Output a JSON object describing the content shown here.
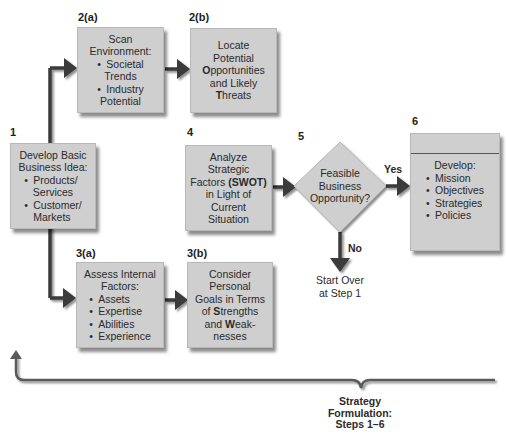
{
  "steps": {
    "s1": {
      "number": "1",
      "title_line1": "Develop Basic",
      "title_line2": "Business Idea:",
      "bullets": [
        "Products/",
        "Services",
        "Customer/",
        "Markets"
      ]
    },
    "s2a": {
      "number": "2(a)",
      "title_line1": "Scan",
      "title_line2": "Environment:",
      "bullets": [
        "Societal",
        "Trends",
        "Industry",
        "Potential"
      ]
    },
    "s2b": {
      "number": "2(b)",
      "lines": [
        "Locate",
        "Potential"
      ],
      "opp_bold": "O",
      "opp_rest": "pportunities",
      "line4": "and Likely",
      "threat_bold": "T",
      "threat_rest": "hreats"
    },
    "s3a": {
      "number": "3(a)",
      "title_line1": "Assess Internal",
      "title_line2": "Factors:",
      "bullets": [
        "Assets",
        "Expertise",
        "Abilities",
        "Experience"
      ]
    },
    "s3b": {
      "number": "3(b)",
      "lines": [
        "Consider",
        "Personal",
        "Goals in Terms"
      ],
      "str_pre": "of ",
      "str_bold": "S",
      "str_rest": "trengths",
      "weak_pre": "and ",
      "weak_bold": "W",
      "weak_rest": "eak-",
      "last": "nesses"
    },
    "s4": {
      "number": "4",
      "lines": [
        "Analyze",
        "Strategic"
      ],
      "factors_pre": "Factors ",
      "factors_bold": "(SWOT)",
      "lines2": [
        "in Light of",
        "Current",
        "Situation"
      ]
    },
    "s5": {
      "number": "5",
      "lines": [
        "Feasible",
        "Business",
        "Opportunity?"
      ],
      "yes_label": "Yes",
      "no_label": "No",
      "no_result_line1": "Start Over",
      "no_result_line2": "at Step 1"
    },
    "s6": {
      "number": "6",
      "title": "Develop:",
      "bullets": [
        "Mission",
        "Objectives",
        "Strategies",
        "Policies"
      ]
    }
  },
  "footer": {
    "line1": "Strategy",
    "line2": "Formulation:",
    "line3": "Steps 1–6"
  },
  "colors": {
    "box_fill": "#cfcfcf",
    "arrow": "#3a3a3a",
    "brace": "#5a5a5a"
  }
}
